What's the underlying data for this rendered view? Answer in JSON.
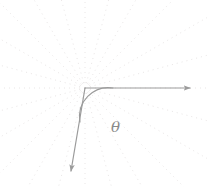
{
  "figure": {
    "type": "geometry-diagram",
    "width": 207,
    "height": 187,
    "background_color": "#ffffff",
    "ray_color": "#9b9b9b",
    "arc_color": "#9b9b9b",
    "grid_color": "#e9e6e6",
    "label_color": "#8a8a8a",
    "origin": {
      "x": 85,
      "y": 88
    },
    "angle_label": {
      "text": "θ",
      "name": "theta",
      "x": 111,
      "y": 120
    },
    "rays": [
      {
        "name": "horizontal-ray",
        "from": {
          "x": 85,
          "y": 88
        },
        "to": {
          "x": 190,
          "y": 88
        },
        "arrowhead": true,
        "direction_degrees": 0
      },
      {
        "name": "lower-left-ray",
        "from": {
          "x": 85,
          "y": 88
        },
        "to": {
          "x": 71,
          "y": 171
        },
        "arrowhead": true,
        "direction_degrees": 260
      }
    ],
    "arc": {
      "name": "angle-arc",
      "start": {
        "x": 113,
        "y": 88
      },
      "end": {
        "x": 80,
        "y": 122
      },
      "radius": 29
    },
    "grid": {
      "type": "radial-dotted",
      "ray_count": 24,
      "dash_pattern": "1 4"
    }
  }
}
